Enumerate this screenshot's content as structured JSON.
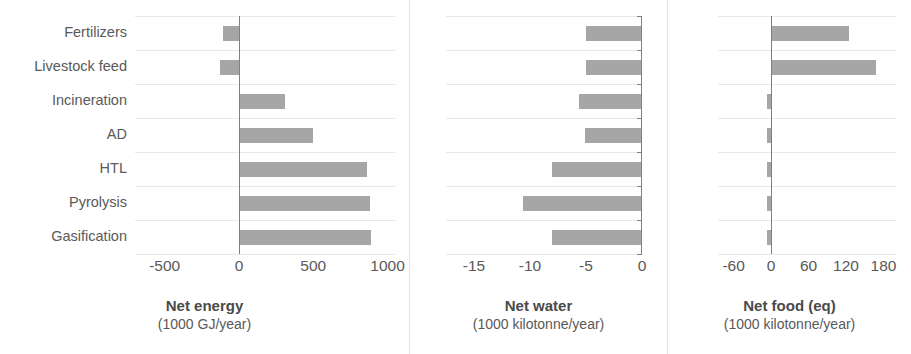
{
  "figure": {
    "background": "#ffffff",
    "bar_color": "#a6a6a6",
    "axis_color": "#808080",
    "grid_color": "#e8e8e8",
    "text_color": "#595959"
  },
  "categories": [
    "Fertilizers",
    "Livestock feed",
    "Incineration",
    "AD",
    "HTL",
    "Pyrolysis",
    "Gasification"
  ],
  "panels": [
    {
      "title": "Net energy",
      "unit": "(1000 GJ/year)",
      "ticks": [
        -500,
        0,
        500,
        1000
      ],
      "tick_labels": [
        "-500",
        "0",
        "500",
        "1000"
      ],
      "xmin": -700,
      "xmax": 1050,
      "values": [
        -110,
        -130,
        310,
        500,
        860,
        880,
        890
      ]
    },
    {
      "title": "Net water",
      "unit": "(1000 kilotonne/year)",
      "ticks": [
        -15,
        -10,
        -5,
        0
      ],
      "tick_labels": [
        "-15",
        "-10",
        "-5",
        "0"
      ],
      "xmin": -17.5,
      "xmax": 0,
      "values": [
        -5.0,
        -5.0,
        -5.6,
        -5.1,
        -8.0,
        -10.6,
        -8.0
      ]
    },
    {
      "title": "Net food (eq)",
      "unit": "(1000 kilotonne/year)",
      "ticks": [
        -60,
        0,
        60,
        120,
        180
      ],
      "tick_labels": [
        "-60",
        "0",
        "60",
        "120",
        "180"
      ],
      "xmin": -85,
      "xmax": 200,
      "values": [
        125,
        168,
        -6,
        -7,
        -7,
        -6,
        -7
      ]
    }
  ],
  "chart_data": {
    "type": "bar",
    "orientation": "horizontal",
    "title": "",
    "grid": true,
    "legend": "none",
    "categories": [
      "Fertilizers",
      "Livestock feed",
      "Incineration",
      "AD",
      "HTL",
      "Pyrolysis",
      "Gasification"
    ],
    "panels": [
      {
        "xlabel": "Net energy",
        "xunit": "(1000 GJ/year)",
        "ylabel": "",
        "xticks": [
          -500,
          0,
          500,
          1000
        ],
        "xlim": [
          -700,
          1050
        ],
        "values": [
          -110,
          -130,
          310,
          500,
          860,
          880,
          890
        ]
      },
      {
        "xlabel": "Net water",
        "xunit": "(1000 kilotonne/year)",
        "ylabel": "",
        "xticks": [
          -15,
          -10,
          -5,
          0
        ],
        "xlim": [
          -17.5,
          0
        ],
        "values": [
          -5.0,
          -5.0,
          -5.6,
          -5.1,
          -8.0,
          -10.6,
          -8.0
        ]
      },
      {
        "xlabel": "Net food (eq)",
        "xunit": "(1000 kilotonne/year)",
        "ylabel": "",
        "xticks": [
          -60,
          0,
          60,
          120,
          180
        ],
        "xlim": [
          -85,
          200
        ],
        "values": [
          125,
          168,
          -6,
          -7,
          -7,
          -6,
          -7
        ]
      }
    ]
  }
}
